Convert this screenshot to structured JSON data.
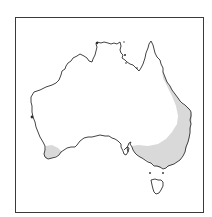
{
  "map": {
    "region": "Australia",
    "description": "Outline map of Australia with shaded distribution range",
    "colors": {
      "background": "#ffffff",
      "frame": "#3a3a3a",
      "coastline": "#2e2e2e",
      "shaded_range": "#d9d9d9"
    },
    "shaded_areas": [
      "south-west Western Australia",
      "eastern Queensland, New South Wales, Victoria and south-eastern South Australia"
    ],
    "frame": {
      "x": 15,
      "y": 17,
      "width": 189,
      "height": 196
    }
  }
}
